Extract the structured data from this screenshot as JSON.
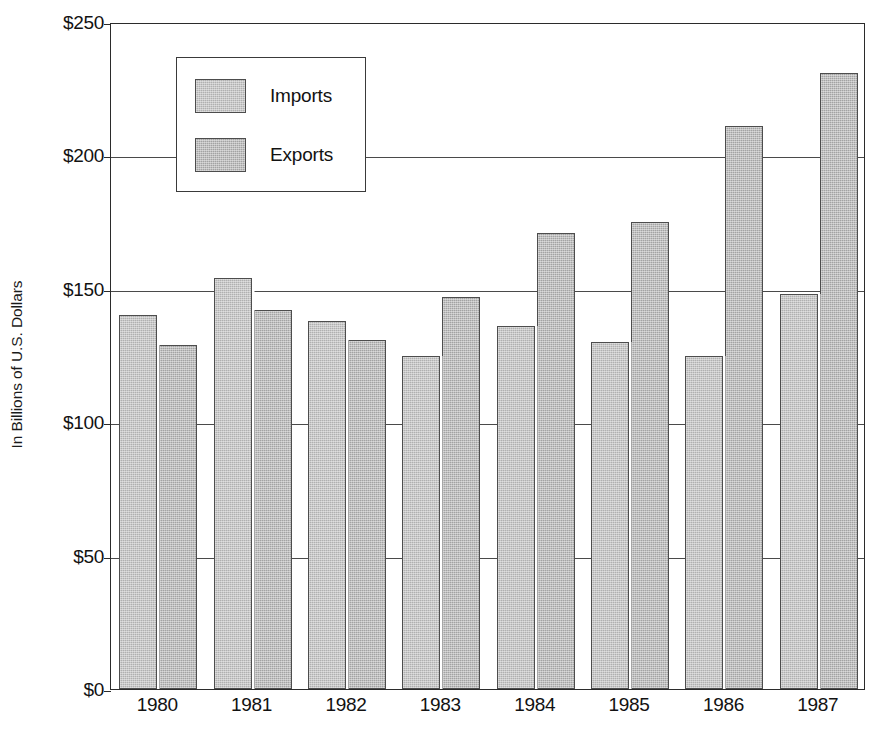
{
  "chart_data": {
    "type": "bar",
    "title": "",
    "xlabel": "",
    "ylabel": "In Billions of U.S. Dollars",
    "categories": [
      "1980",
      "1981",
      "1982",
      "1983",
      "1984",
      "1985",
      "1986",
      "1987"
    ],
    "series": [
      {
        "name": "Imports",
        "values": [
          140,
          154,
          138,
          125,
          136,
          130,
          125,
          148
        ],
        "color": "#b0b0b0"
      },
      {
        "name": "Exports",
        "values": [
          129,
          142,
          131,
          147,
          171,
          175,
          211,
          231
        ],
        "color": "#a3a3a3"
      }
    ],
    "ylim": [
      0,
      250
    ],
    "y_ticks": [
      0,
      50,
      100,
      150,
      200,
      250
    ],
    "y_tick_labels": [
      "$0",
      "$50",
      "$100",
      "$150",
      "$200",
      "$250"
    ],
    "grid": true,
    "legend_position": "upper-left-inside",
    "bar_border_color": "#4d4d4d",
    "axis_color": "#2b2b2b",
    "gridline_color": "#4a4a4a"
  },
  "axis": {
    "y_title": "In Billions of U.S. Dollars",
    "y_labels": [
      "$250",
      "$200",
      "$150",
      "$100",
      "$50",
      "$0"
    ],
    "x_labels": [
      "1980",
      "1981",
      "1982",
      "1983",
      "1984",
      "1985",
      "1986",
      "1987"
    ]
  },
  "legend": {
    "items": [
      {
        "label": "Imports",
        "swatch": "imports-swatch"
      },
      {
        "label": "Exports",
        "swatch": "exports-swatch"
      }
    ]
  },
  "source_note": ""
}
